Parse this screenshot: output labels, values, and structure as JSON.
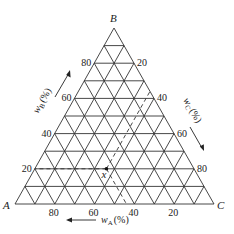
{
  "diagram": {
    "type": "ternary",
    "vertices": {
      "A": "A",
      "B": "B",
      "C": "C"
    },
    "axes": {
      "A": {
        "label": "w",
        "sub": "A",
        "unit": "(%)",
        "ticks": [
          "80",
          "60",
          "40",
          "20"
        ]
      },
      "B": {
        "label": "w",
        "sub": "B",
        "unit": "(%)",
        "ticks": [
          "20",
          "40",
          "60",
          "80"
        ]
      },
      "C": {
        "label": "w",
        "sub": "C",
        "unit": "(%)",
        "ticks": [
          "20",
          "40",
          "60",
          "80"
        ]
      }
    },
    "grid_divisions": 10,
    "point": {
      "label": "x",
      "wB": 20
    }
  }
}
